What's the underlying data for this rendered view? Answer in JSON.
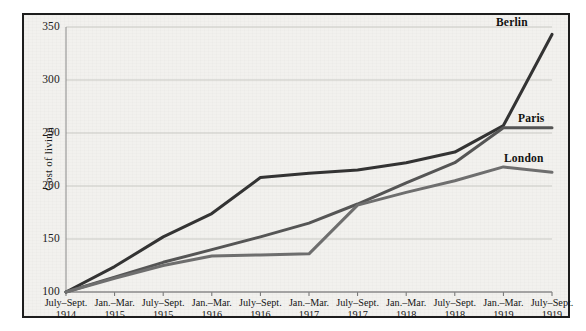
{
  "figure": {
    "background_color": "#f2f1ee",
    "frame_color": "#1d1d1d"
  },
  "axis": {
    "y_title": "Cost of living",
    "y_ticks": [
      "350",
      "300",
      "250",
      "200",
      "150",
      "100"
    ],
    "x_ticks": [
      {
        "period": "July–Sept.",
        "year": "1914"
      },
      {
        "period": "Jan.–Mar.",
        "year": "1915"
      },
      {
        "period": "July–Sept.",
        "year": "1915"
      },
      {
        "period": "Jan.–Mar.",
        "year": "1916"
      },
      {
        "period": "July–Sept.",
        "year": "1916"
      },
      {
        "period": "Jan.–Mar.",
        "year": "1917"
      },
      {
        "period": "July–Sept.",
        "year": "1917"
      },
      {
        "period": "Jan.–Mar.",
        "year": "1918"
      },
      {
        "period": "July–Sept.",
        "year": "1918"
      },
      {
        "period": "Jan.–Mar.",
        "year": "1919"
      },
      {
        "period": "July–Sept.",
        "year": "1919"
      }
    ]
  },
  "series_labels": {
    "berlin": "Berlin",
    "paris": "Paris",
    "london": "London"
  },
  "chart_data": {
    "type": "line",
    "title": "",
    "xlabel": "",
    "ylabel": "Cost of living",
    "ylim": [
      100,
      350
    ],
    "yticks": [
      100,
      150,
      200,
      250,
      300,
      350
    ],
    "grid": "horizontal",
    "legend": "inline-right-of-line-ends",
    "categories": [
      "July–Sept. 1914",
      "Jan.–Mar. 1915",
      "July–Sept. 1915",
      "Jan.–Mar. 1916",
      "July–Sept. 1916",
      "Jan.–Mar. 1917",
      "July–Sept. 1917",
      "Jan.–Mar. 1918",
      "July–Sept. 1918",
      "Jan.–Mar. 1919",
      "July–Sept. 1919"
    ],
    "series": [
      {
        "name": "Berlin",
        "color": "#333333",
        "values": [
          100,
          124,
          152,
          174,
          208,
          212,
          215,
          222,
          232,
          257,
          343
        ]
      },
      {
        "name": "Paris",
        "color": "#555555",
        "values": [
          100,
          114,
          128,
          140,
          152,
          165,
          183,
          203,
          222,
          255,
          255
        ]
      },
      {
        "name": "London",
        "color": "#6e6e6e",
        "values": [
          100,
          113,
          125,
          134,
          135,
          136,
          182,
          194,
          205,
          218,
          213
        ]
      }
    ]
  }
}
